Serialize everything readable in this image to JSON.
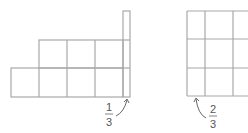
{
  "figures": [
    {
      "name": "left-figure",
      "description": "Staircase of unit squares: bottom row 4 squares plus 1/3 strip, middle row 3 squares plus 1/3 strip, top 1/3 strip only",
      "label": {
        "numerator": "1",
        "denominator": "3"
      }
    },
    {
      "name": "right-figure",
      "description": "3x3 grid of squares, partially cropped on the right",
      "label": {
        "numerator": "2",
        "denominator": "3"
      }
    }
  ],
  "colors": {
    "grid": "#a8a8a8",
    "label": "#555555"
  }
}
